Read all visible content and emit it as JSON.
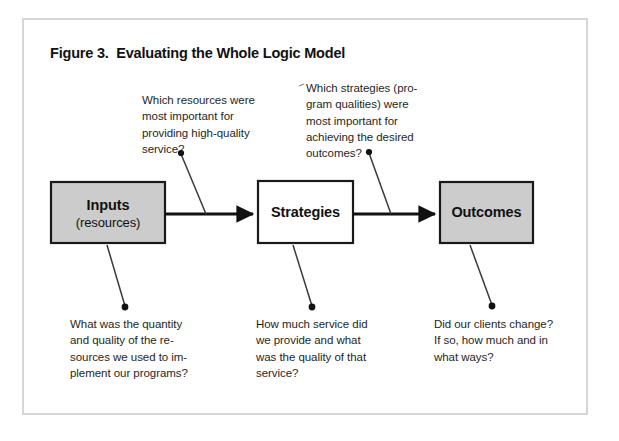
{
  "figure": {
    "title": "Figure 3.  Evaluating the Whole Logic Model",
    "frame_color": "#d6d6d6",
    "background": "#ffffff"
  },
  "diagram": {
    "type": "logic-model-flow",
    "box_fill_shaded": "#cccccc",
    "box_fill_plain": "#ffffff",
    "box_stroke": "#1a1a1a",
    "connector_color": "#111111",
    "leader_color": "#3a3a3a",
    "boxes": [
      {
        "id": "inputs",
        "primary": "Inputs",
        "secondary": "(resources)",
        "shaded": true
      },
      {
        "id": "strategies",
        "primary": "Strategies",
        "secondary": "",
        "shaded": false
      },
      {
        "id": "outcomes",
        "primary": "Outcomes",
        "secondary": "",
        "shaded": true
      }
    ],
    "arrows": [
      {
        "id": "inputs-to-strategies",
        "from": "inputs",
        "to": "strategies"
      },
      {
        "id": "strategies-to-outcomes",
        "from": "strategies",
        "to": "outcomes"
      }
    ]
  },
  "notes": {
    "resources_question": "Which resources were\nmost important for\nproviding high-quality\nservice?",
    "strategies_question": "Which strategies (pro-\ngram qualities) were\nmost important for\nachieving the desired\noutcomes?",
    "inputs_question": "What was the quantity\nand quality of the re-\nsources we used to im-\nplement our programs?",
    "service_question": "How much service did\nwe provide and what\nwas the quality of that\nservice?",
    "clients_question": "Did our clients change?\nIf so, how much and in\nwhat ways?"
  }
}
